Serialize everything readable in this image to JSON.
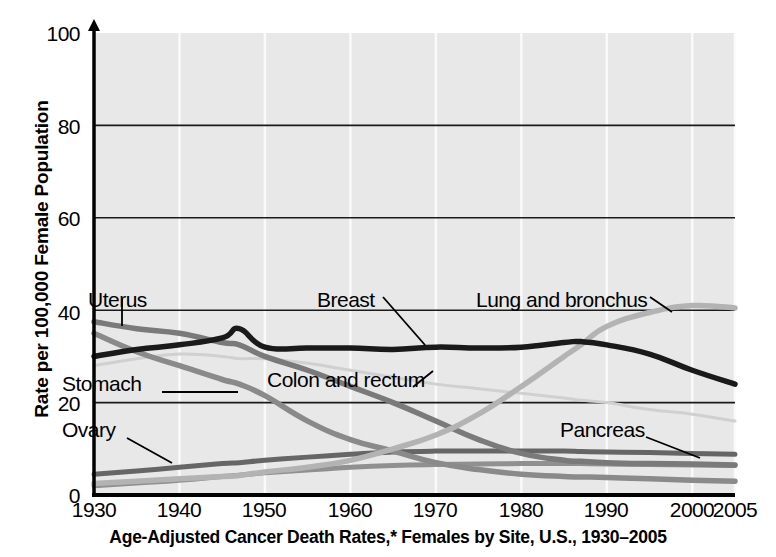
{
  "chart_data": {
    "type": "line",
    "title": "Age-Adjusted Cancer Death Rates,* Females by Site, U.S., 1930–2005",
    "xlabel": "",
    "ylabel": "Rate per 100,000 Female Population",
    "xlim": [
      1930,
      2005
    ],
    "ylim": [
      0,
      100
    ],
    "grid": true,
    "legend_position": "inline-annotations",
    "xticks": [
      "1930",
      "1940",
      "1950",
      "1960",
      "1970",
      "1980",
      "1990",
      "2000",
      "2005"
    ],
    "xtick_values": [
      1930,
      1940,
      1950,
      1960,
      1970,
      1980,
      1990,
      2000,
      2005
    ],
    "yticks": [
      "0",
      "20",
      "40",
      "60",
      "80",
      "100"
    ],
    "ytick_values": [
      0,
      20,
      40,
      60,
      80,
      100
    ],
    "x": [
      1930,
      1935,
      1940,
      1945,
      1947,
      1950,
      1955,
      1960,
      1965,
      1970,
      1975,
      1980,
      1985,
      1987,
      1990,
      1995,
      2000,
      2005
    ],
    "series": [
      {
        "name": "Lung and bronchus",
        "color": "#b3b3b3",
        "width": 5.5,
        "values": [
          2.5,
          3.0,
          3.5,
          4.0,
          4.2,
          5.0,
          6.0,
          7.5,
          10.0,
          13.0,
          17.5,
          23.5,
          30.0,
          32.5,
          36.5,
          39.5,
          41.0,
          40.5
        ]
      },
      {
        "name": "Breast",
        "color": "#1a1a1a",
        "width": 5.5,
        "values": [
          30.0,
          31.5,
          32.5,
          34.0,
          36.0,
          32.0,
          31.8,
          31.8,
          31.5,
          32.0,
          31.8,
          32.0,
          33.0,
          33.2,
          32.5,
          30.5,
          27.0,
          24.0
        ]
      },
      {
        "name": "Uterus",
        "color": "#7a7a7a",
        "width": 5.5,
        "values": [
          37.5,
          36.0,
          35.0,
          33.0,
          32.5,
          30.0,
          27.0,
          23.5,
          20.0,
          16.0,
          12.0,
          9.0,
          7.5,
          7.3,
          7.0,
          6.8,
          6.7,
          6.5
        ]
      },
      {
        "name": "Stomach",
        "color": "#8a8a8a",
        "width": 5.5,
        "values": [
          35.0,
          31.0,
          28.0,
          25.0,
          24.0,
          21.5,
          16.0,
          12.0,
          9.5,
          7.0,
          5.5,
          4.5,
          4.0,
          3.9,
          3.8,
          3.5,
          3.2,
          3.0
        ]
      },
      {
        "name": "Colon and rectum",
        "color": "#d0d0d0",
        "width": 3.0,
        "values": [
          28.0,
          29.5,
          30.5,
          30.0,
          29.5,
          29.5,
          28.5,
          27.0,
          25.5,
          24.0,
          23.0,
          22.0,
          21.0,
          20.5,
          20.0,
          18.5,
          17.5,
          16.0
        ]
      },
      {
        "name": "Ovary",
        "color": "#666666",
        "width": 5.0,
        "values": [
          4.5,
          5.2,
          6.0,
          6.8,
          7.0,
          7.5,
          8.2,
          8.8,
          9.3,
          9.5,
          9.5,
          9.5,
          9.5,
          9.4,
          9.3,
          9.2,
          9.0,
          8.8
        ]
      },
      {
        "name": "Pancreas",
        "color": "#909090",
        "width": 5.0,
        "values": [
          2.0,
          2.6,
          3.2,
          4.0,
          4.3,
          4.8,
          5.4,
          6.0,
          6.4,
          6.6,
          6.7,
          6.8,
          6.8,
          6.8,
          6.7,
          6.6,
          6.5,
          6.4
        ]
      }
    ],
    "annotations": [
      {
        "label": "Uterus",
        "x_px": 88,
        "y_px": 288,
        "leader": [
          [
            122,
            298
          ],
          [
            122,
            326
          ]
        ]
      },
      {
        "label": "Stomach",
        "x_px": 62,
        "y_px": 383,
        "leader": [
          [
            162,
            392
          ],
          [
            238,
            392
          ]
        ]
      },
      {
        "label": "Ovary",
        "x_px": 62,
        "y_px": 428,
        "leader": [
          [
            127,
            438
          ],
          [
            172,
            463
          ]
        ]
      },
      {
        "label": "Breast",
        "x_px": 317,
        "y_px": 288,
        "leader": [
          [
            383,
            297
          ],
          [
            425,
            345
          ]
        ]
      },
      {
        "label": "Lung and bronchus",
        "x_px": 476,
        "y_px": 288,
        "leader": [
          [
            650,
            297
          ],
          [
            672,
            312
          ]
        ]
      },
      {
        "label": "Colon and rectum",
        "x_px": 267,
        "y_px": 378,
        "leader": [
          [
            413,
            387
          ],
          [
            433,
            371
          ]
        ]
      },
      {
        "label": "Pancreas",
        "x_px": 560,
        "y_px": 428,
        "leader": [
          [
            646,
            437
          ],
          [
            700,
            458
          ]
        ]
      }
    ]
  },
  "plot": {
    "bg_color": "#e8e8e8",
    "axis_color": "#000000",
    "gridline_color": "#1a1a1a",
    "vgrid_color": "#fafafa",
    "left_px": 94,
    "right_px": 735,
    "top_px": 33,
    "bottom_px": 495
  },
  "caption": {
    "text": "Age-Adjusted Cancer Death Rates,* Females by Site, U.S., 1930–2005"
  }
}
